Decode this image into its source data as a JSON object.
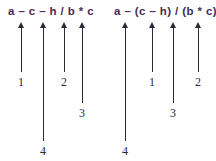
{
  "figure": {
    "background_color": "#ffffff",
    "expression_color": "#4a2a5a",
    "annotation_color": "#2b2b38"
  },
  "panels": [
    {
      "id": "left",
      "expression": "a – c – h / b * c",
      "annotations": [
        {
          "label": "1",
          "arrow_x": 21,
          "arrow_top": 22,
          "arrow_bottom": 72,
          "label_x": 21,
          "label_y": 76
        },
        {
          "label": "4",
          "arrow_x": 43,
          "arrow_top": 22,
          "arrow_bottom": 141,
          "label_x": 43,
          "label_y": 145
        },
        {
          "label": "2",
          "arrow_x": 64,
          "arrow_top": 22,
          "arrow_bottom": 72,
          "label_x": 64,
          "label_y": 76
        },
        {
          "label": "3",
          "arrow_x": 82,
          "arrow_top": 22,
          "arrow_bottom": 103,
          "label_x": 82,
          "label_y": 107
        }
      ]
    },
    {
      "id": "right",
      "expression": "a – (c – h) / (b * c)",
      "annotations": [
        {
          "label": "4",
          "arrow_x": 125,
          "arrow_top": 22,
          "arrow_bottom": 141,
          "label_x": 125,
          "label_y": 145
        },
        {
          "label": "1",
          "arrow_x": 152,
          "arrow_top": 22,
          "arrow_bottom": 72,
          "label_x": 152,
          "label_y": 76
        },
        {
          "label": "3",
          "arrow_x": 173,
          "arrow_top": 22,
          "arrow_bottom": 103,
          "label_x": 173,
          "label_y": 107
        },
        {
          "label": "2",
          "arrow_x": 198,
          "arrow_top": 22,
          "arrow_bottom": 72,
          "label_x": 198,
          "label_y": 76
        }
      ]
    }
  ]
}
